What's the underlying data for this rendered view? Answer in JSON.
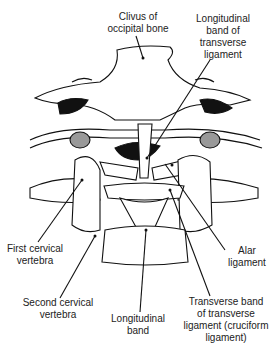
{
  "figure": {
    "labels": [
      {
        "id": "clivus",
        "text": "Clivus of\noccipital bone",
        "x": 102,
        "y": 11,
        "w": 72
      },
      {
        "id": "longitudinal-band-transverse",
        "text": "Longitudinal\nband of\ntransverse\nligament",
        "x": 180,
        "y": 13,
        "w": 86
      },
      {
        "id": "alar",
        "text": "Alar\nligament",
        "x": 222,
        "y": 245,
        "w": 50
      },
      {
        "id": "first-cervical",
        "text": "First cervical\nvertebra",
        "x": 2,
        "y": 243,
        "w": 66
      },
      {
        "id": "second-cervical",
        "text": "Second cervical\nvertebra",
        "x": 18,
        "y": 297,
        "w": 80
      },
      {
        "id": "longitudinal-band",
        "text": "Longitudinal\nband",
        "x": 108,
        "y": 313,
        "w": 60
      },
      {
        "id": "transverse-band",
        "text": "Transverse band\nof transverse\nligament (cruciform\nligament)",
        "x": 178,
        "y": 296,
        "w": 96
      }
    ]
  }
}
